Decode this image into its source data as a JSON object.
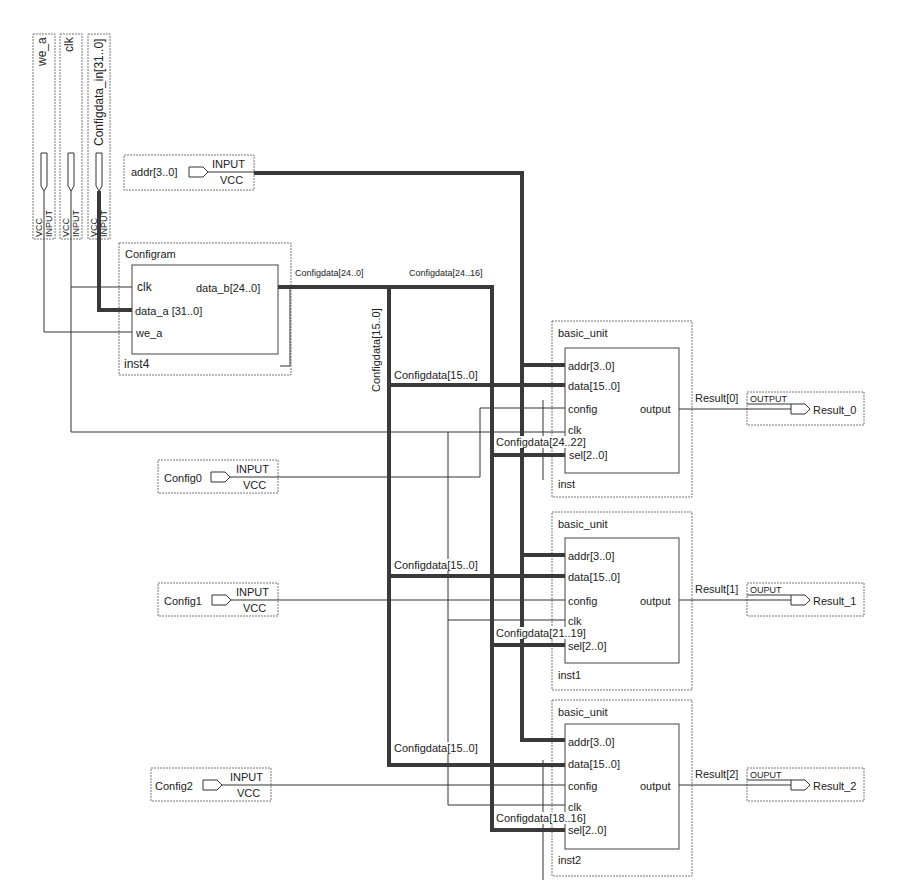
{
  "diagram": {
    "type": "block schematic",
    "colors": {
      "wire": "#333333",
      "bus": "#3a3a3a",
      "dotted_border": "#777777"
    }
  },
  "vertical_inputs": [
    {
      "name": "we_a",
      "type": "INPUT",
      "default": "VCC"
    },
    {
      "name": "clk",
      "type": "INPUT",
      "default": "VCC"
    },
    {
      "name": "Configdata_in[31..0]",
      "type": "INPUT",
      "default": "VCC"
    }
  ],
  "inputs": {
    "addr": {
      "name": "addr[3..0]",
      "type": "INPUT",
      "default": "VCC"
    },
    "config0": {
      "name": "Config0",
      "type": "INPUT",
      "default": "VCC"
    },
    "config1": {
      "name": "Config1",
      "type": "INPUT",
      "default": "VCC"
    },
    "config2": {
      "name": "Config2",
      "type": "INPUT",
      "default": "VCC"
    }
  },
  "configram": {
    "title": "Configram",
    "instance": "inst4",
    "ports_in": [
      "clk",
      "data_a [31..0]",
      "we_a"
    ],
    "port_out": "data_b[24..0]"
  },
  "bus_labels": {
    "configdata_24_0": "Configdata[24..0]",
    "configdata_24_16": "Configdata[24..16]",
    "configdata_15_0_vertical": "Configdata[15..0]",
    "configdata_15_0_a": "Configdata[15..0]",
    "configdata_15_0_b": "Configdata[15..0]",
    "configdata_15_0_c": "Configdata[15..0]",
    "configdata_24_22": "Configdata[24..22]",
    "configdata_21_19": "Configdata[21..19]",
    "configdata_18_16": "Configdata[18..16]"
  },
  "units": [
    {
      "title": "basic_unit",
      "instance": "inst",
      "ports_in": [
        "addr[3..0]",
        "data[15..0]",
        "config",
        "clk",
        "sel[2..0]"
      ],
      "port_out": "output",
      "result_wire": "Result[0]",
      "output_pin": {
        "type": "OUTPUT",
        "name": "Result_0"
      }
    },
    {
      "title": "basic_unit",
      "instance": "inst1",
      "ports_in": [
        "addr[3..0]",
        "data[15..0]",
        "config",
        "clk",
        "sel[2..0]"
      ],
      "port_out": "output",
      "result_wire": "Result[1]",
      "output_pin": {
        "type": "OUPUT",
        "name": "Result_1"
      }
    },
    {
      "title": "basic_unit",
      "instance": "inst2",
      "ports_in": [
        "addr[3..0]",
        "data[15..0]",
        "config",
        "clk",
        "sel[2..0]"
      ],
      "port_out": "output",
      "result_wire": "Result[2]",
      "output_pin": {
        "type": "OUPUT",
        "name": "Result_2"
      }
    }
  ]
}
